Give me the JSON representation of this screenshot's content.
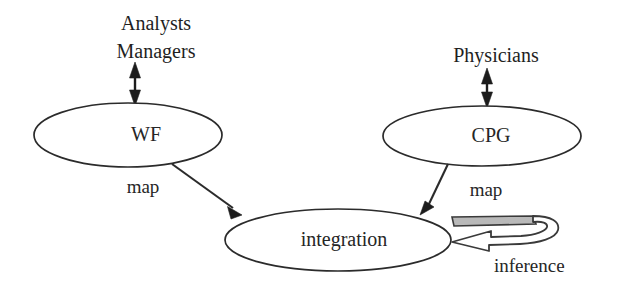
{
  "figure": {
    "background_color": "#ffffff",
    "line_color": "#2b2b2b"
  },
  "nodes": [
    {
      "id": "wf",
      "label": "WF"
    },
    {
      "id": "cpg",
      "label": "CPG"
    },
    {
      "id": "integration",
      "label": "integration"
    }
  ],
  "actors": [
    {
      "id": "analysts-managers",
      "line1": "Analysts",
      "line2": "Managers"
    },
    {
      "id": "physicians",
      "line1": "Physicians"
    }
  ],
  "edges": [
    {
      "id": "wf-to-integration",
      "label": "map"
    },
    {
      "id": "cpg-to-integration",
      "label": "map"
    },
    {
      "id": "integration-self-loop",
      "label": "inference"
    }
  ]
}
